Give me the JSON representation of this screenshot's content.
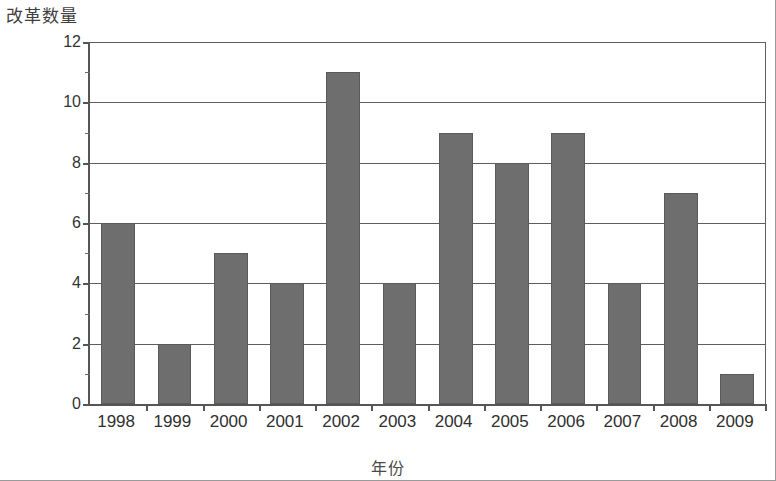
{
  "chart_data": {
    "type": "bar",
    "title": "",
    "xlabel": "年份",
    "ylabel": "改革数量",
    "categories": [
      "1998",
      "1999",
      "2000",
      "2001",
      "2002",
      "2003",
      "2004",
      "2005",
      "2006",
      "2007",
      "2008",
      "2009"
    ],
    "values": [
      6,
      2,
      5,
      4,
      11,
      4,
      9,
      8,
      9,
      4,
      7,
      1
    ],
    "series": [
      {
        "name": "改革数量",
        "values": [
          6,
          2,
          5,
          4,
          11,
          4,
          9,
          8,
          9,
          4,
          7,
          1
        ]
      }
    ],
    "ylim": [
      0,
      12
    ],
    "y_ticks": [
      "0",
      "2",
      "4",
      "6",
      "8",
      "10",
      "12"
    ],
    "y_tick_values": [
      0,
      2,
      4,
      6,
      8,
      10,
      12
    ],
    "y_minor_tick_values": [
      1,
      3,
      5,
      7,
      9,
      11
    ],
    "grid": true,
    "grid_axis": "y",
    "legend": "none",
    "bar_color": "#6e6e6e",
    "axis_color": "#555555",
    "grid_color": "#5e5e5e",
    "background_color": "#ffffff"
  },
  "axes": {
    "y_title": "改革数量",
    "x_title": "年份"
  }
}
